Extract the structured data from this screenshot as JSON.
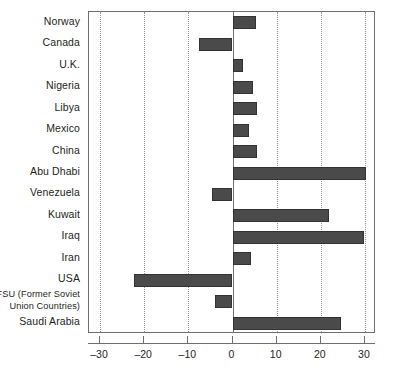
{
  "chart_data": {
    "type": "bar",
    "orientation": "horizontal",
    "title": "",
    "subtitle": "",
    "xlabel": "",
    "ylabel": "",
    "xlim": [
      -32.5,
      32.5
    ],
    "grid": true,
    "legend": null,
    "xticks": [
      -30,
      -20,
      -10,
      0,
      10,
      20,
      30
    ],
    "xtick_labels": [
      "–30",
      "–20",
      "–10",
      "0",
      "10",
      "20",
      "30"
    ],
    "categories": [
      "Norway",
      "Canada",
      "U.K.",
      "Nigeria",
      "Libya",
      "Mexico",
      "China",
      "Abu Dhabi",
      "Venezuela",
      "Kuwait",
      "Iraq",
      "Iran",
      "USA",
      "FSU (Former Soviet\nUnion Countries)",
      "Saudi Arabia"
    ],
    "values": [
      5.3,
      -7.7,
      2.4,
      4.6,
      5.5,
      3.7,
      5.5,
      30.3,
      -4.6,
      21.8,
      29.7,
      4.2,
      -22.2,
      -4.0,
      24.6
    ],
    "bar_color": "#4a4a4a",
    "bar_edge_color": "#333333",
    "axis_color": "#6d6e71",
    "gridline_color": "#939598",
    "text_color": "#231f20"
  }
}
